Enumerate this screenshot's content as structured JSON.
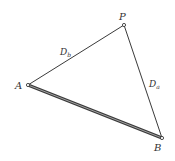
{
  "diagram": {
    "type": "triangle",
    "colors": {
      "line": "#3a3a3a",
      "background": "#ffffff"
    },
    "vertices": {
      "P": {
        "label": "P",
        "x": 124,
        "y": 25
      },
      "A": {
        "label": "A",
        "x": 28,
        "y": 85
      },
      "B": {
        "label": "B",
        "x": 162,
        "y": 138
      }
    },
    "edges": [
      {
        "from": "A",
        "to": "P",
        "label": "D",
        "subscript": "b",
        "style": "thin"
      },
      {
        "from": "P",
        "to": "B",
        "label": "D",
        "subscript": "a",
        "style": "thin"
      },
      {
        "from": "A",
        "to": "B",
        "label": "",
        "style": "thick-double"
      }
    ]
  }
}
